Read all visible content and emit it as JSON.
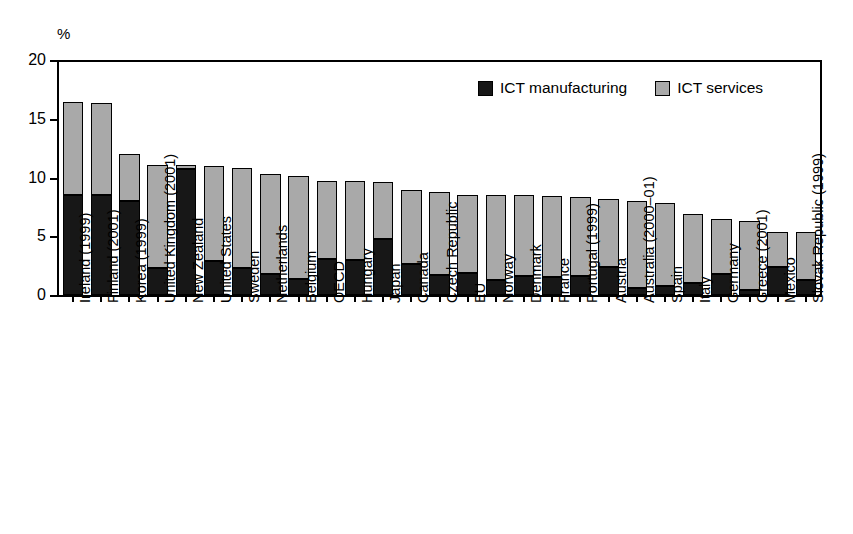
{
  "chart_data": {
    "type": "bar",
    "stacked": true,
    "title": "",
    "subtitle": "",
    "xlabel": "",
    "ylabel": "",
    "unit_label": "%",
    "ylim": [
      0,
      20
    ],
    "yticks": [
      0,
      5,
      10,
      15,
      20
    ],
    "ytick_labels": [
      "0",
      "5",
      "10",
      "15",
      "20"
    ],
    "grid": false,
    "legend_position": "top-right",
    "categories": [
      "Ireland (1999)",
      "Finland (2001)",
      "Korea (1999)",
      "United Kingdom (2001)",
      "New Zealand",
      "United States",
      "Sweden",
      "Netherlands",
      "Belgium",
      "OECD",
      "Hungary",
      "Japan",
      "Canada",
      "Czech Republic",
      "EU",
      "Norway",
      "Denmark",
      "France",
      "Portugal (1999)",
      "Austria",
      "Australia (2000–01)",
      "Spain",
      "Italy",
      "Germany",
      "Greece (2001)",
      "Mexico",
      "Slovak Republic (1999)"
    ],
    "series": [
      {
        "name": "ICT manufacturing",
        "color": "#171717",
        "values": [
          8.5,
          8.5,
          8.0,
          2.3,
          10.7,
          2.9,
          2.3,
          1.8,
          1.4,
          3.1,
          3.0,
          4.8,
          2.6,
          1.7,
          1.9,
          1.3,
          1.6,
          1.5,
          1.6,
          2.4,
          0.6,
          0.8,
          1.0,
          1.8,
          0.4,
          2.4,
          1.3
        ]
      },
      {
        "name": "ICT services",
        "color": "#a9a9a9",
        "values": [
          7.9,
          7.8,
          4.0,
          8.8,
          0.4,
          8.1,
          8.5,
          8.5,
          8.7,
          6.6,
          6.7,
          4.8,
          6.3,
          7.1,
          6.6,
          7.2,
          6.9,
          6.9,
          6.7,
          5.8,
          7.4,
          7.0,
          5.9,
          4.7,
          5.9,
          3.0,
          4.1
        ]
      }
    ],
    "totals": [
      16.4,
      16.3,
      12.0,
      11.1,
      11.1,
      11.0,
      10.8,
      10.3,
      10.1,
      9.7,
      9.7,
      9.6,
      8.9,
      8.8,
      8.5,
      8.5,
      8.5,
      8.4,
      8.3,
      8.2,
      8.0,
      7.8,
      6.9,
      6.5,
      6.3,
      5.4,
      5.4
    ]
  },
  "legend": {
    "items": [
      {
        "label": "ICT manufacturing",
        "swatch": "manufacturing"
      },
      {
        "label": "ICT services",
        "swatch": "services"
      }
    ]
  },
  "colors": {
    "manufacturing": "#171717",
    "services": "#a9a9a9",
    "axis": "#000000",
    "background": "#ffffff"
  }
}
